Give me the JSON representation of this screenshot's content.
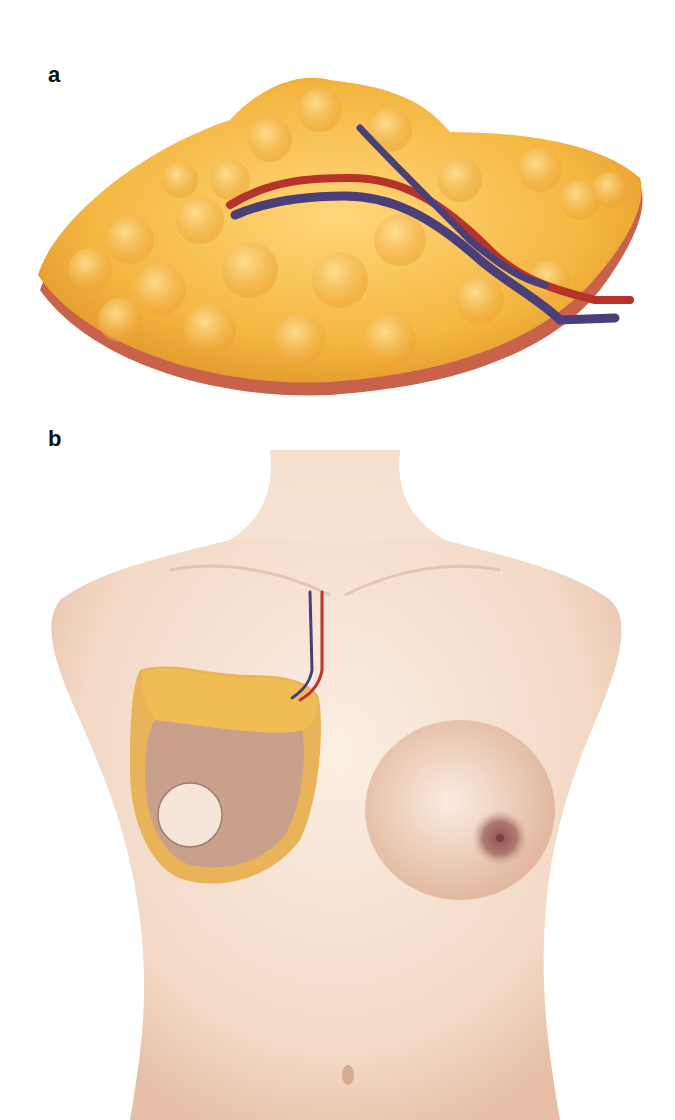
{
  "figure": {
    "panels": [
      {
        "label": "a",
        "subject": "isolated adipose tissue flap with vascular pedicle (artery and vein)"
      },
      {
        "label": "b",
        "subject": "frontal female torso with flap inset at right breast; pedicle vessels routed to chest wall"
      }
    ]
  },
  "colors": {
    "fat": "#f4b640",
    "fat_highlight": "#ffd77a",
    "fat_shadow": "#d98a22",
    "flap_base": "#c9624a",
    "artery": "#b5332a",
    "vein": "#4a3f78",
    "skin": "#f3d9c6",
    "skin_shadow": "#d9ad94",
    "flap_skin": "#c9a08c",
    "nipple": "#a8706a"
  }
}
